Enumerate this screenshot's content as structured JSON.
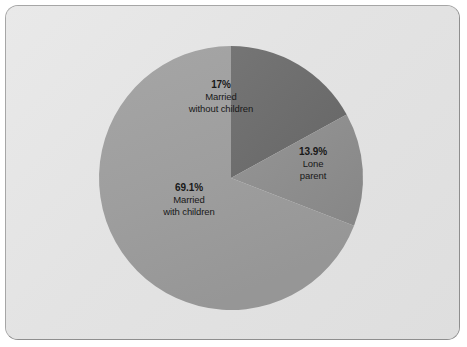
{
  "figure": {
    "background_color": "#e5e5e5",
    "border_color": "#a6a6a6",
    "canvas_color": "#ffffff"
  },
  "chart_data": {
    "type": "pie",
    "title": "",
    "subtitle": "",
    "xlabel": "",
    "ylabel": "",
    "legend_position": "none",
    "grid": false,
    "start_angle_deg": 90,
    "direction": "clockwise",
    "units": "percent",
    "categories": [
      "Married without children",
      "Lone parent",
      "Married with children"
    ],
    "values": [
      17,
      13.9,
      69.1
    ],
    "value_labels": [
      "17%",
      "13.9%",
      "69.1%"
    ],
    "colors": [
      "#6e6e6e",
      "#8d8d8d",
      "#9e9e9e"
    ],
    "slices": [
      {
        "name": "married-without-children",
        "percent_label": "17%",
        "value": 17,
        "label_lines": [
          "Married",
          "without children"
        ],
        "color": "#6e6e6e"
      },
      {
        "name": "lone-parent",
        "percent_label": "13.9%",
        "value": 13.9,
        "label_lines": [
          "Lone",
          "parent"
        ],
        "color": "#8d8d8d"
      },
      {
        "name": "married-with-children",
        "percent_label": "69.1%",
        "value": 69.1,
        "label_lines": [
          "Married",
          "with children"
        ],
        "color": "#9e9e9e"
      }
    ]
  }
}
